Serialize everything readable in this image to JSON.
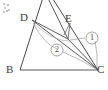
{
  "figure": {
    "kind": "geometry-diagram",
    "background_color": "#ffffff",
    "stroke_color": "#4a4a4a",
    "faint_stroke_color": "#9b9b9b",
    "labels": {
      "d": "D",
      "b": "B",
      "c": "C",
      "e": "E",
      "angle_one": "1",
      "angle_two": "2"
    },
    "points": {
      "apex": {
        "x": 46,
        "y": -10
      },
      "d": {
        "x": 32,
        "y": 20
      },
      "b": {
        "x": 20,
        "y": 70
      },
      "c": {
        "x": 98,
        "y": 70
      },
      "e": {
        "x": 68,
        "y": 39
      }
    },
    "label_positions": {
      "d": {
        "x": 21,
        "y": 13
      },
      "b": {
        "x": 8,
        "y": 70
      },
      "c": {
        "x": 97,
        "y": 70
      },
      "e": {
        "x": 66,
        "y": 14
      },
      "angle_one": {
        "x": 89,
        "y": 34
      },
      "angle_two": {
        "x": 54,
        "y": 46
      }
    }
  }
}
